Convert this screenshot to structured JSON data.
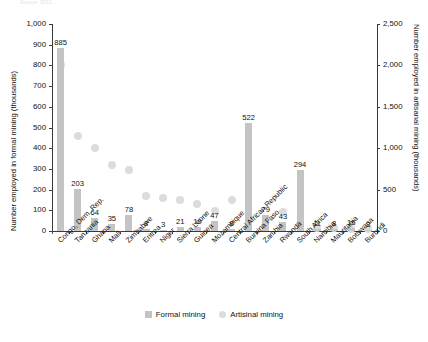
{
  "caption_fragment": "Source: 2011",
  "axes": {
    "left_title": "Number employed in formal mining (thousands)",
    "right_title": "Number employed in artisanal mining (thousands)",
    "left_ticks": [
      "1,000",
      "900",
      "800",
      "700",
      "600",
      "500",
      "400",
      "300",
      "200",
      "100",
      "0"
    ],
    "right_ticks": [
      "2,500",
      "2,000",
      "1,500",
      "1,000",
      "500",
      "0"
    ]
  },
  "legend": {
    "formal_label": "Formal mining",
    "artisanal_label": "Artisinal mining",
    "formal_color": "#c4c4c4",
    "artisanal_color": "#dcdcdc"
  },
  "chart_data": {
    "type": "bar",
    "title": "",
    "xlabel": "",
    "ylabel": "Number employed in formal mining (thousands)",
    "y2label": "Number employed in artisanal mining (thousands)",
    "ylim": [
      0,
      1000
    ],
    "y2lim": [
      0,
      2500
    ],
    "grid": false,
    "legend_position": "bottom",
    "categories": [
      "Congo, Dem. Rep.",
      "Tanzania",
      "Ghana",
      "Mali",
      "Zimbabwe",
      "Eritrea",
      "Niger",
      "Sierra Leone",
      "Guinea",
      "Mozambique",
      "Central African Republic",
      "Burkina Faso",
      "Zambia",
      "Rwanda",
      "South Africa",
      "Namibia",
      "Mauritania",
      "Botswana",
      "Burundi"
    ],
    "series": [
      {
        "name": "Formal mining",
        "axis": "left",
        "marker": "bar",
        "values": [
          885,
          203,
          64,
          35,
          78,
          8,
          3,
          21,
          19,
          47,
          8,
          522,
          79,
          43,
          294,
          11,
          8,
          16,
          3
        ]
      },
      {
        "name": "Artisinal mining",
        "axis": "right",
        "marker": "circle",
        "values": [
          2000,
          1150,
          1000,
          800,
          740,
          420,
          400,
          370,
          330,
          240,
          380,
          140,
          150,
          230,
          90,
          40,
          35,
          30,
          25
        ]
      }
    ]
  }
}
